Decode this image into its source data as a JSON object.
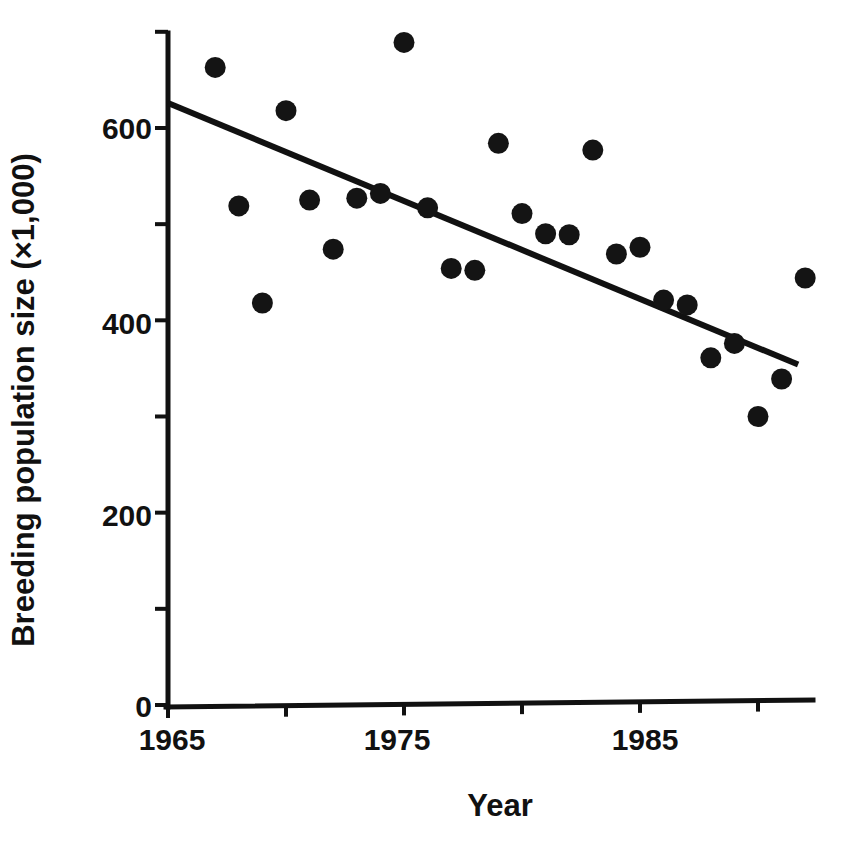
{
  "figure": {
    "background_color": "#ffffff",
    "ink_color": "#111111",
    "point_color": "#141414"
  },
  "chart_data": {
    "type": "scatter",
    "title": "",
    "subtitle": "",
    "xlabel": "Year",
    "ylabel": "Breeding population size (×1,000)",
    "xlim": [
      1965,
      1992.3
    ],
    "ylim": [
      0,
      698
    ],
    "grid": false,
    "legend": null,
    "x_ticks_major": [
      1965,
      1975,
      1985
    ],
    "x_tick_labels": [
      "1965",
      "1975",
      "1985"
    ],
    "x_ticks_minor": [
      1970,
      1980,
      1990
    ],
    "y_ticks_major": [
      0,
      200,
      400,
      600
    ],
    "y_tick_labels": [
      "0",
      "200",
      "400",
      "600"
    ],
    "y_ticks_minor": [
      100,
      300,
      500,
      700
    ],
    "series": [
      {
        "name": "Breeding population size",
        "marker": "filled-circle",
        "x": [
          1967,
          1968,
          1969,
          1970,
          1971,
          1972,
          1973,
          1974,
          1975,
          1976,
          1977,
          1978,
          1979,
          1980,
          1981,
          1982,
          1983,
          1984,
          1985,
          1986,
          1987,
          1988,
          1989,
          1990,
          1991,
          1992
        ],
        "y": [
          663,
          519,
          418,
          618,
          525,
          474,
          527,
          532,
          689,
          517,
          454,
          452,
          584,
          511,
          490,
          489,
          577,
          469,
          476,
          421,
          416,
          361,
          376,
          300,
          339,
          444
        ]
      }
    ],
    "fit_line": {
      "name": "linear regression",
      "x_start": 1965,
      "x_end": 1991.7,
      "y_start": 626,
      "y_end": 354
    }
  },
  "axes": {
    "x_axis_name": "year-axis",
    "y_axis_name": "population-axis"
  }
}
